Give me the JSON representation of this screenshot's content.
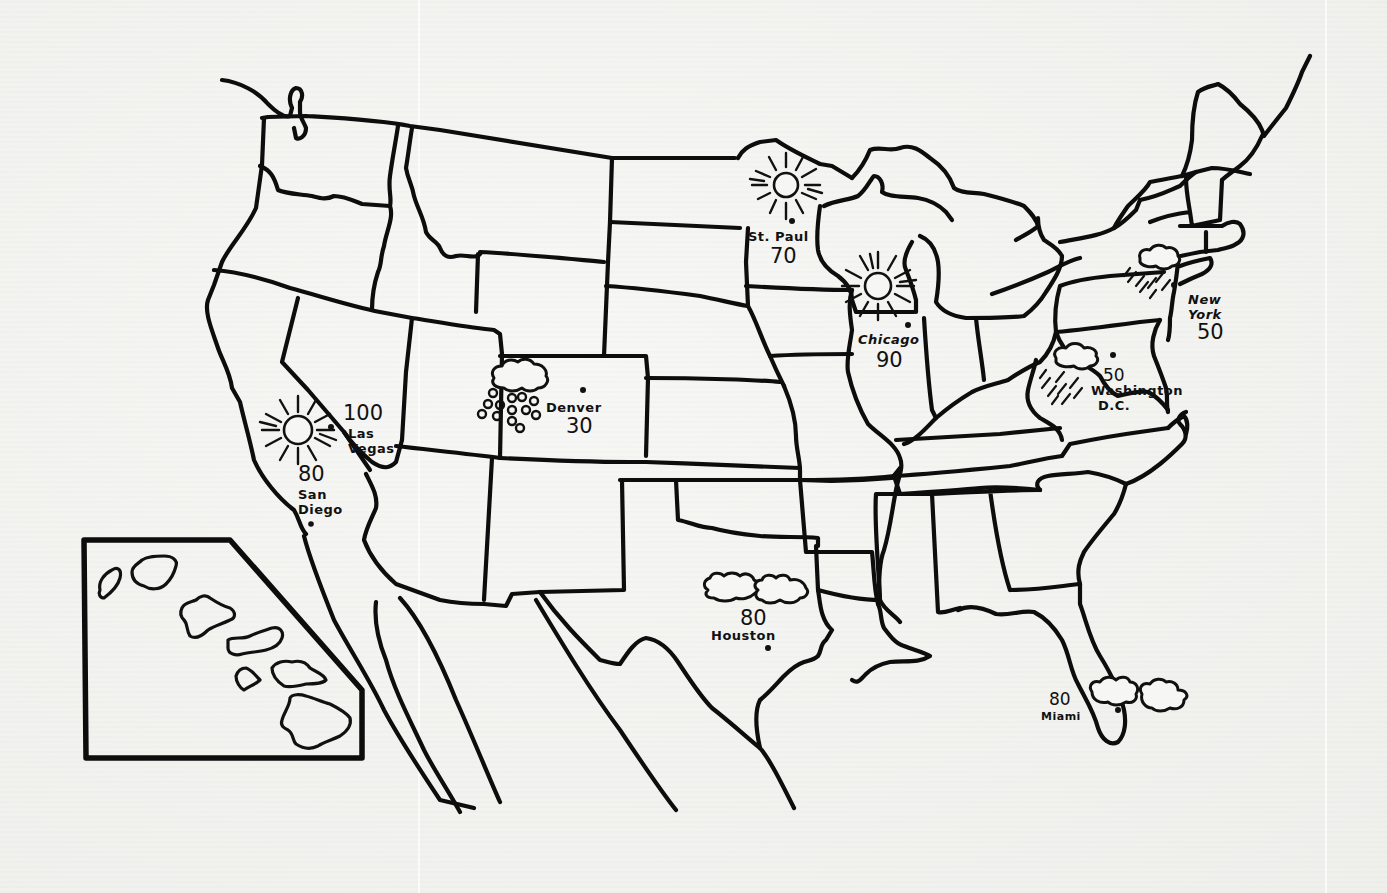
{
  "map": {
    "title": "United States Weather Map",
    "style": "hand-drawn black outline on paper",
    "colors": {
      "ink": "#111111",
      "paper": "#f3f3f1"
    },
    "inset": {
      "label": "Hawaii inset",
      "islands": 8
    },
    "cities": [
      {
        "name": "St. Paul",
        "temp": "70",
        "weather": "sunny",
        "icon": "sun-icon"
      },
      {
        "name": "Chicago",
        "temp": "90",
        "weather": "sunny",
        "icon": "sun-icon"
      },
      {
        "name": "Las Vegas",
        "temp": "100",
        "weather": "sunny",
        "icon": "sun-icon"
      },
      {
        "name": "San Diego",
        "temp": "80",
        "weather": "sunny",
        "icon": "sun-icon"
      },
      {
        "name": "Denver",
        "temp": "30",
        "weather": "snow",
        "icon": "snow-cloud-icon"
      },
      {
        "name": "New York",
        "temp": "50",
        "weather": "rain",
        "icon": "rain-cloud-icon"
      },
      {
        "name": "Washington D.C.",
        "name_line1": "Washington",
        "name_line2": "D.C.",
        "temp": "50",
        "weather": "rain",
        "icon": "rain-cloud-icon"
      },
      {
        "name": "Houston",
        "temp": "80",
        "weather": "cloudy",
        "icon": "cloud-icon"
      },
      {
        "name": "Miami",
        "temp": "80",
        "weather": "cloudy",
        "icon": "cloud-icon"
      }
    ]
  }
}
